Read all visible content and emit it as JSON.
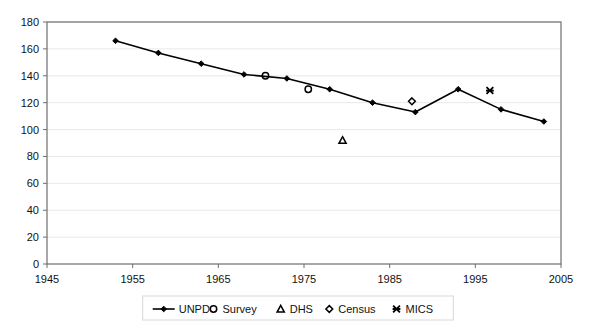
{
  "chart_data": {
    "type": "line",
    "title": "",
    "subtitle": "",
    "xlabel": "",
    "ylabel": "",
    "xlim": [
      1945,
      2005
    ],
    "ylim": [
      0,
      180
    ],
    "xticks": [
      1945,
      1955,
      1965,
      1975,
      1985,
      1995,
      2005
    ],
    "yticks": [
      0,
      20,
      40,
      60,
      80,
      100,
      120,
      140,
      160,
      180
    ],
    "grid": "horizontal",
    "legend_position": "bottom",
    "series": [
      {
        "name": "UNPD",
        "marker": "filled-diamond",
        "style": "line",
        "color": "#000000",
        "x": [
          1953,
          1958,
          1963,
          1968,
          1973,
          1978,
          1983,
          1988,
          1993,
          1998,
          2003
        ],
        "values": [
          166,
          157,
          149,
          141,
          138,
          130,
          120,
          113,
          130,
          115,
          106
        ]
      },
      {
        "name": "Survey",
        "marker": "open-circle",
        "style": "points",
        "color": "#000000",
        "x": [
          1970.5,
          1975.5
        ],
        "values": [
          140,
          130
        ]
      },
      {
        "name": "DHS",
        "marker": "open-triangle",
        "style": "points",
        "color": "#000000",
        "x": [
          1979.5
        ],
        "values": [
          92
        ]
      },
      {
        "name": "Census",
        "marker": "open-diamond",
        "style": "points",
        "color": "#000000",
        "x": [
          1987.6
        ],
        "values": [
          121
        ]
      },
      {
        "name": "MICS",
        "marker": "x-mark",
        "style": "points",
        "color": "#000000",
        "x": [
          1996.7
        ],
        "values": [
          129
        ]
      }
    ]
  },
  "axes": {
    "y_tick_labels": [
      "180",
      "160",
      "140",
      "120",
      "100",
      "80",
      "60",
      "40",
      "20",
      "0"
    ],
    "x_tick_labels": [
      "1945",
      "1955",
      "1965",
      "1975",
      "1985",
      "1995",
      "2005"
    ]
  },
  "legend": {
    "items": [
      {
        "label": "UNPD",
        "icon": "line-with-diamond-marker"
      },
      {
        "label": "Survey",
        "icon": "circle-marker"
      },
      {
        "label": "DHS",
        "icon": "triangle-marker"
      },
      {
        "label": "Census",
        "icon": "diamond-marker"
      },
      {
        "label": "MICS",
        "icon": "x-marker"
      }
    ]
  },
  "colors": {
    "series": "#000000",
    "grid": "#e9e9e9",
    "axis": "#6f6f6f",
    "background": "#ffffff"
  }
}
